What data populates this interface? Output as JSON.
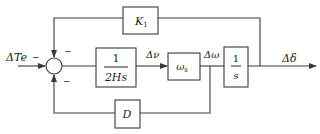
{
  "diagram": {
    "type": "control-block-diagram",
    "input": {
      "label": "ΔTe",
      "sign": "−"
    },
    "summing_junction": {
      "signs": {
        "top": "−",
        "bottom": "−",
        "left": "−"
      }
    },
    "blocks": [
      {
        "id": "k1",
        "label": "K1",
        "path": "feedback-top"
      },
      {
        "id": "inertia",
        "numerator": "1",
        "denominator": "2Hs",
        "path": "forward"
      },
      {
        "id": "omega_s",
        "label": "ωs",
        "path": "forward"
      },
      {
        "id": "integrator",
        "numerator": "1",
        "denominator": "s",
        "path": "forward"
      },
      {
        "id": "damping",
        "label": "D",
        "path": "feedback-bottom"
      }
    ],
    "signals": {
      "delta_nu": "Δν",
      "delta_omega": "Δω",
      "delta_delta": "Δδ"
    },
    "colors": {
      "line": "#3a3a3a",
      "background": "#ffffff"
    }
  }
}
